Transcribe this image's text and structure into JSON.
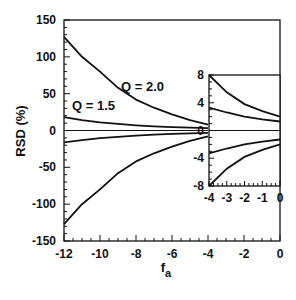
{
  "chart_data": {
    "type": "line",
    "title": "",
    "xlabel": "f_a",
    "ylabel": "RSD (%)",
    "xlim": [
      -12,
      0
    ],
    "ylim": [
      -150,
      150
    ],
    "xticks": [
      -12,
      -10,
      -8,
      -6,
      -4,
      -2,
      0
    ],
    "yticks": [
      150,
      100,
      50,
      0,
      -50,
      -100,
      -150
    ],
    "grid": false,
    "x": [
      -12,
      -11,
      -10,
      -9,
      -8,
      -7,
      -6,
      -5,
      -4,
      -3,
      -2,
      -1,
      0
    ],
    "series": [
      {
        "name": "Q = 2.0 (+)",
        "values": [
          127,
          100,
          80,
          58,
          42,
          31,
          22,
          14,
          8,
          5.5,
          3.8,
          2.8,
          2.0
        ]
      },
      {
        "name": "Q = 1.5 (+)",
        "values": [
          18,
          14,
          11,
          9,
          7,
          5.5,
          4.5,
          3.8,
          3.3,
          2.6,
          2.0,
          1.6,
          1.3
        ]
      },
      {
        "name": "zero",
        "values": [
          0,
          0,
          0,
          0,
          0,
          0,
          0,
          0,
          0,
          0,
          0,
          0,
          0
        ]
      },
      {
        "name": "Q = 1.5 (-)",
        "values": [
          -16,
          -13,
          -10.5,
          -8.5,
          -7,
          -5.5,
          -4.5,
          -3.8,
          -3.3,
          -2.6,
          -2.0,
          -1.6,
          -1.3
        ]
      },
      {
        "name": "Q = 2.0 (-)",
        "values": [
          -127,
          -100,
          -80,
          -58,
          -42,
          -31,
          -22,
          -14,
          -8,
          -5.5,
          -3.8,
          -2.8,
          -2.0
        ]
      }
    ],
    "annotations": [
      "Q = 2.0",
      "Q = 1.5"
    ],
    "inset": {
      "xlim": [
        -4,
        0
      ],
      "ylim": [
        -8,
        8
      ],
      "xticks": [
        -4,
        -3,
        -2,
        -1,
        0
      ],
      "yticks": [
        8,
        4,
        0,
        -4,
        -8
      ]
    }
  },
  "labels": {
    "xlabel_main": "f",
    "xlabel_sub": "a",
    "ylabel": "RSD (%)",
    "q20": "Q = 2.0",
    "q15": "Q = 1.5"
  }
}
